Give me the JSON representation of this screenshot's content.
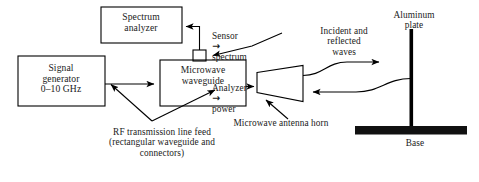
{
  "figure": {
    "background_color": "#ffffff",
    "line_color": "#000000",
    "text_color": "#1a1a1a",
    "fill_color": "#000000"
  },
  "blocks": {
    "spectrum_analyzer": {
      "label": "Spectrum\nanalyzer"
    },
    "signal_generator": {
      "label": "Signal\ngenerator\n0–10 GHz"
    },
    "microwave_waveguide": {
      "label": "Microwave\nwaveguide"
    },
    "sensor_connector": {
      "label": ""
    }
  },
  "notes": {
    "sensor_chain_line1_a": "Sensor",
    "sensor_chain_line1_arrow": "→",
    "sensor_chain_line1_b": "spectrum",
    "sensor_chain_line2_a": "Analyzer",
    "sensor_chain_line2_arrow": "→",
    "sensor_chain_line2_b": "power",
    "incident_reflected_waves": "Incident and\nreflected\nwaves",
    "aluminum_plate": "Aluminum\nplate",
    "base": "Base",
    "antenna_horn": "Microwave antenna horn",
    "rf_feed": "RF transmission line feed\n(rectangular waveguide and\nconnectors)"
  },
  "icons": {
    "arrow_right": "arrow-right-icon",
    "arrow_left": "arrow-left-icon",
    "arrow_up": "arrow-up-icon"
  }
}
